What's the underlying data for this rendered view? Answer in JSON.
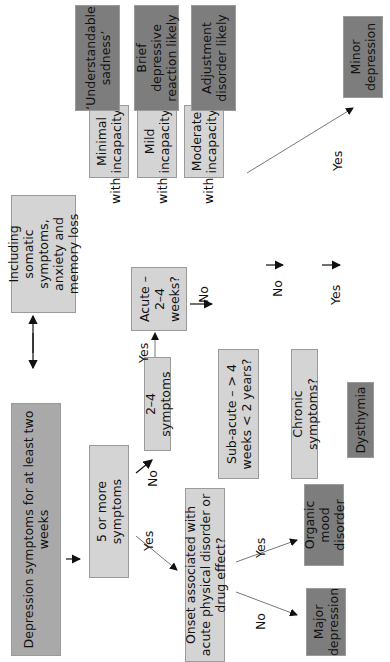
{
  "diagram": {
    "orientation": "rotated 90deg counter-clockwise",
    "nodes": {
      "depression_symptoms": "Depression symptoms for at least two weeks",
      "including_somatic": "Including somatic symptoms, anxiety and memory loss",
      "five_or_more": "5 or more symptoms",
      "two_four_symptoms": "2–4 symptoms",
      "acute": "Acute – 2–4 weeks?",
      "subacute": "Sub-acute – > 4 weeks < 2 years?",
      "chronic": "Chronic symptoms?",
      "dysthymia": "Dysthymia",
      "onset": "Onset associated with acute physical disorder or drug effect?",
      "organic": "Organic mood disorder",
      "major": "Major depression",
      "minor": "Minor depression",
      "minimal_incapacity": "Minimal incapacity",
      "mild_incapacity": "Mild incapacity",
      "moderate_incapacity": "Moderate incapacity",
      "understandable_sadness": "‘Understandable sadness’",
      "brief_reaction": "Brief depressive reaction likely",
      "adjustment": "Adjustment disorder likely"
    },
    "edge_labels": {
      "yes": "Yes",
      "no": "No",
      "with": "with"
    },
    "colors": {
      "light_box": "#d4d4d4",
      "mid_box": "#a9a9a9",
      "dark_box": "#7d7d7d"
    }
  }
}
